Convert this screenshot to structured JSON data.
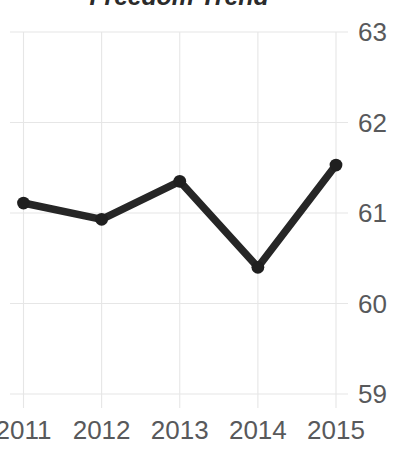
{
  "chart_data": {
    "type": "line",
    "title": "Freedom Trend",
    "xlabel": "",
    "ylabel": "",
    "categories": [
      "2011",
      "2012",
      "2013",
      "2014",
      "2015"
    ],
    "values": [
      61.11,
      60.93,
      61.35,
      60.4,
      61.53
    ],
    "series": [
      {
        "name": "Freedom Score",
        "values": [
          61.11,
          60.93,
          61.35,
          60.4,
          61.53
        ]
      }
    ],
    "x": [
      2011,
      2012,
      2013,
      2014,
      2015
    ],
    "ylim": [
      59,
      63
    ],
    "xlim": [
      2011,
      2015
    ],
    "y_ticks": [
      "59",
      "60",
      "61",
      "62",
      "63"
    ],
    "y_tick_values": [
      59,
      60,
      61,
      62,
      63
    ],
    "x_ticks": [
      "2011",
      "2012",
      "2013",
      "2014",
      "2015"
    ],
    "grid": true,
    "grid_x": true,
    "grid_y": true,
    "legend": false,
    "legend_position": "none",
    "marker": "circle",
    "line_color": "#262626",
    "marker_color": "#1f1f1f",
    "grid_color": "#e6e6e6",
    "tick_label_color": "#58595b",
    "title_color": "#2b2b2b",
    "background_color": "#ffffff",
    "y_axis_side": "right"
  }
}
